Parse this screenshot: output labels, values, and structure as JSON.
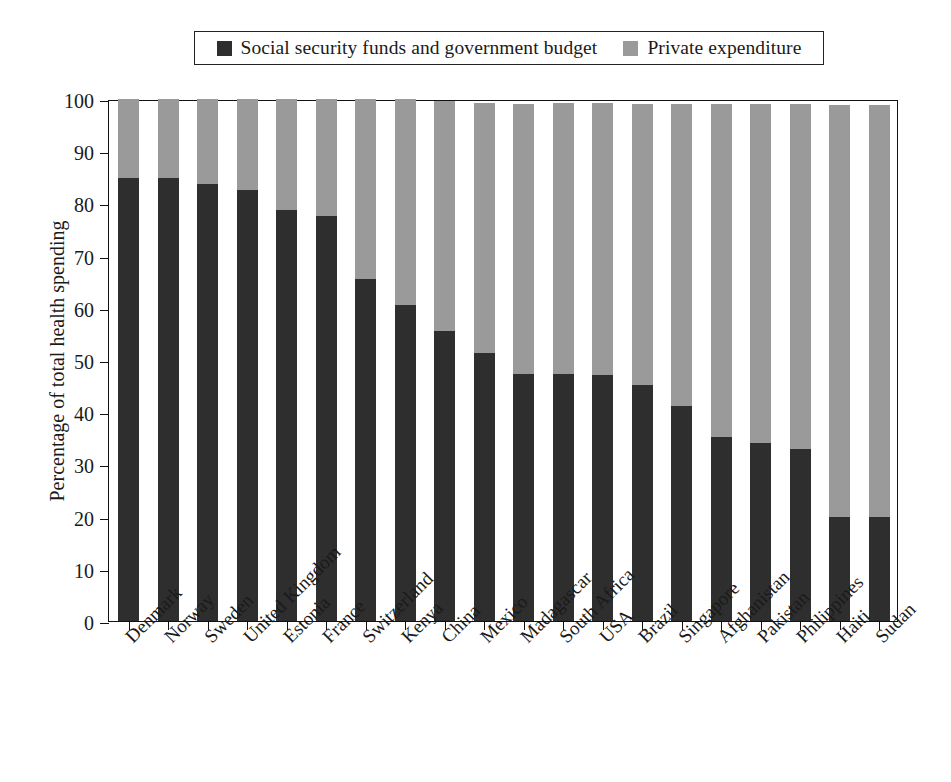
{
  "legend": {
    "entries": [
      {
        "label": "Social security funds and government budget",
        "color": "#2e2e2e",
        "key": "public"
      },
      {
        "label": "Private expenditure",
        "color": "#9a9a9a",
        "key": "private"
      }
    ]
  },
  "colors": {
    "public": "#2e2e2e",
    "private": "#9a9a9a",
    "axis": "#111111",
    "background": "#ffffff"
  },
  "chart_data": {
    "type": "bar",
    "subtype": "stacked",
    "title": "",
    "xlabel": "",
    "ylabel": "Percentage of total health spending",
    "ylim": [
      0,
      100
    ],
    "yticks": [
      0,
      10,
      20,
      30,
      40,
      50,
      60,
      70,
      80,
      90,
      100
    ],
    "grid": false,
    "legend_position": "top",
    "categories": [
      "Denmark",
      "Norway",
      "Sweden",
      "United Kingdom",
      "Estonia",
      "France",
      "Switzerland",
      "Kenya",
      "China",
      "Mexico",
      "Madagascar",
      "South Africa",
      "USA",
      "Brazil",
      "Singapore",
      "Afghanistan",
      "Pakistan",
      "Philippines",
      "Haiti",
      "Sudan"
    ],
    "series": [
      {
        "name": "Social security funds and government budget",
        "color": "#2e2e2e",
        "values": [
          84.8,
          84.8,
          83.8,
          82.6,
          78.7,
          77.6,
          65.6,
          60.5,
          55.5,
          51.4,
          47.4,
          47.3,
          47.2,
          45.2,
          41.2,
          35.2,
          34.1,
          33.0,
          20.0,
          20.0
        ]
      },
      {
        "name": "Private expenditure",
        "color": "#9a9a9a",
        "values": [
          15.2,
          15.2,
          16.2,
          17.4,
          21.3,
          22.4,
          34.4,
          39.5,
          44.2,
          47.8,
          51.7,
          51.9,
          52.0,
          53.9,
          57.9,
          63.9,
          65.0,
          66.0,
          78.9,
          78.9
        ]
      }
    ],
    "totals": [
      100,
      100,
      100,
      100,
      100,
      100,
      100,
      100,
      99.7,
      99.2,
      99.1,
      99.2,
      99.2,
      99.1,
      99.1,
      99.1,
      99.1,
      99.0,
      98.9,
      98.9
    ]
  }
}
